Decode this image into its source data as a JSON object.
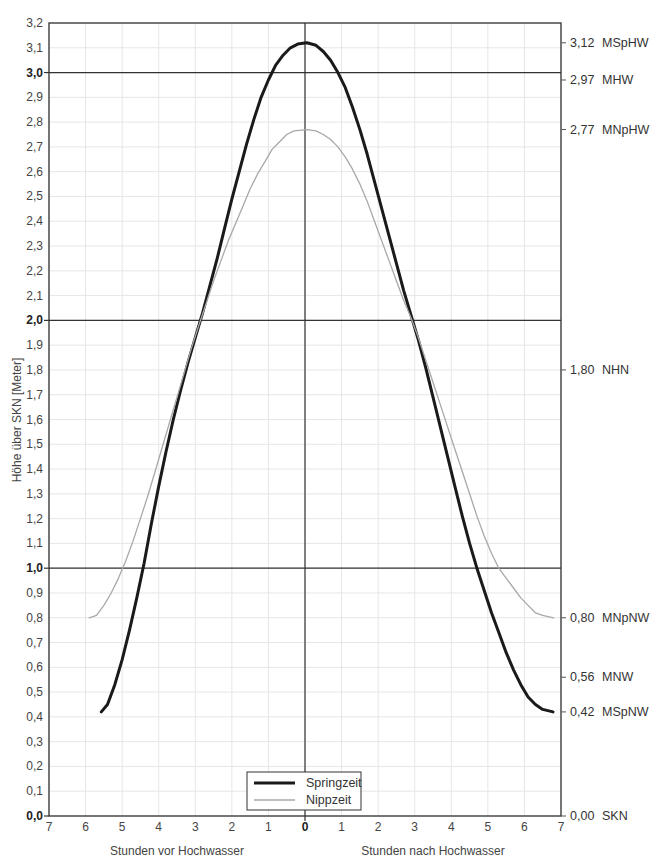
{
  "chart_data": {
    "type": "line",
    "title": "",
    "xlabel_left": "Stunden vor Hochwasser",
    "xlabel_right": "Stunden nach Hochwasser",
    "ylabel": "Höhe über SKN [Meter]",
    "xlim": [
      -7,
      7
    ],
    "ylim": [
      0.0,
      3.2
    ],
    "x_ticks": [
      -7,
      -6,
      -5,
      -4,
      -3,
      -2,
      -1,
      0,
      1,
      2,
      3,
      4,
      5,
      6,
      7
    ],
    "x_tick_labels": [
      "7",
      "6",
      "5",
      "4",
      "3",
      "2",
      "1",
      "0",
      "1",
      "2",
      "3",
      "4",
      "5",
      "6",
      "7"
    ],
    "y_ticks": [
      0.0,
      0.1,
      0.2,
      0.3,
      0.4,
      0.5,
      0.6,
      0.7,
      0.8,
      0.9,
      1.0,
      1.1,
      1.2,
      1.3,
      1.4,
      1.5,
      1.6,
      1.7,
      1.8,
      1.9,
      2.0,
      2.1,
      2.2,
      2.3,
      2.4,
      2.5,
      2.6,
      2.7,
      2.8,
      2.9,
      3.0,
      3.1,
      3.2
    ],
    "y_tick_labels": [
      "0,0",
      "0,1",
      "0,2",
      "0,3",
      "0,4",
      "0,5",
      "0,6",
      "0,7",
      "0,8",
      "0,9",
      "1,0",
      "1,1",
      "1,2",
      "1,3",
      "1,4",
      "1,5",
      "1,6",
      "1,7",
      "1,8",
      "1,9",
      "2,0",
      "2,1",
      "2,2",
      "2,3",
      "2,4",
      "2,5",
      "2,6",
      "2,7",
      "2,8",
      "2,9",
      "3,0",
      "3,1",
      "3,2"
    ],
    "y_bold_ticks": [
      0.0,
      1.0,
      2.0,
      3.0
    ],
    "grid": true,
    "reference_lines_y": [
      1.0,
      2.0,
      3.0
    ],
    "reference_line_x": 0,
    "legend_position": "bottom-center",
    "series": [
      {
        "name": "Springzeit",
        "color": "#1a1a1a",
        "width": 3,
        "points": [
          [
            -5.57,
            0.42
          ],
          [
            -5.4,
            0.45
          ],
          [
            -5.2,
            0.53
          ],
          [
            -5.0,
            0.63
          ],
          [
            -4.8,
            0.75
          ],
          [
            -4.6,
            0.88
          ],
          [
            -4.4,
            1.02
          ],
          [
            -4.2,
            1.18
          ],
          [
            -4.0,
            1.33
          ],
          [
            -3.8,
            1.47
          ],
          [
            -3.6,
            1.6
          ],
          [
            -3.4,
            1.72
          ],
          [
            -3.2,
            1.83
          ],
          [
            -3.0,
            1.93
          ],
          [
            -2.8,
            2.03
          ],
          [
            -2.6,
            2.14
          ],
          [
            -2.4,
            2.25
          ],
          [
            -2.2,
            2.37
          ],
          [
            -2.0,
            2.49
          ],
          [
            -1.8,
            2.6
          ],
          [
            -1.6,
            2.71
          ],
          [
            -1.4,
            2.81
          ],
          [
            -1.2,
            2.9
          ],
          [
            -1.0,
            2.97
          ],
          [
            -0.8,
            3.03
          ],
          [
            -0.6,
            3.07
          ],
          [
            -0.4,
            3.1
          ],
          [
            -0.2,
            3.115
          ],
          [
            0.05,
            3.12
          ],
          [
            0.3,
            3.11
          ],
          [
            0.5,
            3.085
          ],
          [
            0.7,
            3.05
          ],
          [
            0.9,
            3.0
          ],
          [
            1.1,
            2.94
          ],
          [
            1.3,
            2.86
          ],
          [
            1.5,
            2.77
          ],
          [
            1.7,
            2.67
          ],
          [
            1.9,
            2.56
          ],
          [
            2.1,
            2.45
          ],
          [
            2.3,
            2.34
          ],
          [
            2.5,
            2.23
          ],
          [
            2.7,
            2.12
          ],
          [
            2.9,
            2.02
          ],
          [
            3.1,
            1.92
          ],
          [
            3.3,
            1.81
          ],
          [
            3.5,
            1.69
          ],
          [
            3.7,
            1.57
          ],
          [
            3.9,
            1.45
          ],
          [
            4.1,
            1.33
          ],
          [
            4.3,
            1.21
          ],
          [
            4.5,
            1.1
          ],
          [
            4.7,
            1.0
          ],
          [
            4.9,
            0.91
          ],
          [
            5.1,
            0.82
          ],
          [
            5.3,
            0.74
          ],
          [
            5.5,
            0.66
          ],
          [
            5.7,
            0.59
          ],
          [
            5.9,
            0.53
          ],
          [
            6.1,
            0.48
          ],
          [
            6.3,
            0.45
          ],
          [
            6.5,
            0.43
          ],
          [
            6.78,
            0.42
          ]
        ]
      },
      {
        "name": "Nippzeit",
        "color": "#a8a8a8",
        "width": 1.3,
        "points": [
          [
            -5.9,
            0.8
          ],
          [
            -5.7,
            0.81
          ],
          [
            -5.5,
            0.85
          ],
          [
            -5.3,
            0.9
          ],
          [
            -5.1,
            0.96
          ],
          [
            -4.9,
            1.03
          ],
          [
            -4.7,
            1.11
          ],
          [
            -4.5,
            1.2
          ],
          [
            -4.3,
            1.29
          ],
          [
            -4.1,
            1.39
          ],
          [
            -3.9,
            1.49
          ],
          [
            -3.7,
            1.59
          ],
          [
            -3.5,
            1.69
          ],
          [
            -3.3,
            1.79
          ],
          [
            -3.1,
            1.89
          ],
          [
            -2.9,
            1.98
          ],
          [
            -2.7,
            2.07
          ],
          [
            -2.5,
            2.16
          ],
          [
            -2.3,
            2.24
          ],
          [
            -2.1,
            2.32
          ],
          [
            -1.9,
            2.39
          ],
          [
            -1.7,
            2.46
          ],
          [
            -1.5,
            2.53
          ],
          [
            -1.3,
            2.59
          ],
          [
            -1.1,
            2.64
          ],
          [
            -0.9,
            2.69
          ],
          [
            -0.7,
            2.72
          ],
          [
            -0.5,
            2.75
          ],
          [
            -0.3,
            2.765
          ],
          [
            0.05,
            2.77
          ],
          [
            0.3,
            2.765
          ],
          [
            0.5,
            2.75
          ],
          [
            0.7,
            2.73
          ],
          [
            0.9,
            2.7
          ],
          [
            1.1,
            2.66
          ],
          [
            1.3,
            2.61
          ],
          [
            1.5,
            2.55
          ],
          [
            1.7,
            2.48
          ],
          [
            1.9,
            2.4
          ],
          [
            2.1,
            2.32
          ],
          [
            2.3,
            2.24
          ],
          [
            2.5,
            2.16
          ],
          [
            2.7,
            2.08
          ],
          [
            2.9,
            2.01
          ],
          [
            3.1,
            1.93
          ],
          [
            3.3,
            1.84
          ],
          [
            3.5,
            1.75
          ],
          [
            3.7,
            1.66
          ],
          [
            3.9,
            1.57
          ],
          [
            4.1,
            1.48
          ],
          [
            4.3,
            1.39
          ],
          [
            4.5,
            1.3
          ],
          [
            4.7,
            1.21
          ],
          [
            4.9,
            1.13
          ],
          [
            5.1,
            1.06
          ],
          [
            5.3,
            1.0
          ],
          [
            5.5,
            0.96
          ],
          [
            5.7,
            0.92
          ],
          [
            5.9,
            0.88
          ],
          [
            6.1,
            0.85
          ],
          [
            6.3,
            0.82
          ],
          [
            6.5,
            0.81
          ],
          [
            6.8,
            0.8
          ]
        ]
      }
    ],
    "annotations_right": [
      {
        "y": 3.12,
        "value": "3,12",
        "label": "MSpHW"
      },
      {
        "y": 2.97,
        "value": "2,97",
        "label": "MHW"
      },
      {
        "y": 2.77,
        "value": "2,77",
        "label": "MNpHW"
      },
      {
        "y": 1.8,
        "value": "1,80",
        "label": "NHN"
      },
      {
        "y": 0.8,
        "value": "0,80",
        "label": "MNpNW"
      },
      {
        "y": 0.56,
        "value": "0,56",
        "label": "MNW"
      },
      {
        "y": 0.42,
        "value": "0,42",
        "label": "MSpNW"
      },
      {
        "y": 0.0,
        "value": "0,00",
        "label": "SKN"
      }
    ]
  },
  "legend": {
    "items": [
      {
        "label": "Springzeit"
      },
      {
        "label": "Nippzeit"
      }
    ]
  }
}
